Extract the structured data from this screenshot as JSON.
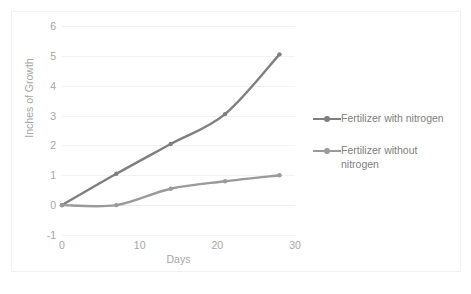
{
  "chart_data": {
    "type": "line",
    "title": "",
    "xlabel": "Days",
    "ylabel": "Inches of Growth",
    "x": [
      0,
      7,
      14,
      21,
      28
    ],
    "xlim": [
      0,
      30
    ],
    "ylim": [
      -1,
      6
    ],
    "xticks": [
      "0",
      "10",
      "20",
      "30"
    ],
    "xtick_values": [
      0,
      10,
      20,
      30
    ],
    "yticks": [
      "-1",
      "0",
      "1",
      "2",
      "3",
      "4",
      "5",
      "6"
    ],
    "ytick_values": [
      -1,
      0,
      1,
      2,
      3,
      4,
      5,
      6
    ],
    "grid": true,
    "legend_position": "right",
    "series": [
      {
        "name": "Fertilizer with nitrogen",
        "values": [
          0,
          1.05,
          2.05,
          3.05,
          5.05
        ],
        "color": "#7f7f7f"
      },
      {
        "name": "Fertilizer without nitrogen",
        "values": [
          0,
          0,
          0.55,
          0.8,
          1.0
        ],
        "color": "#9a9a9a"
      }
    ]
  },
  "legend": {
    "entries": [
      {
        "label": "Fertilizer with nitrogen"
      },
      {
        "label": "Fertilizer without nitrogen"
      }
    ]
  },
  "colors": {
    "series_1": "#7f7f7f",
    "series_2": "#9a9a9a",
    "gridline": "#f2f2f2",
    "tick_text": "#a6a6a6",
    "legend_text": "#808080",
    "frame_border": "#f1f1f1"
  }
}
